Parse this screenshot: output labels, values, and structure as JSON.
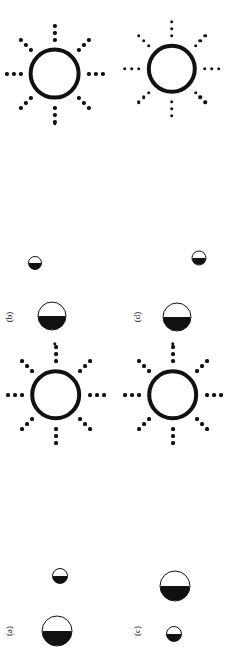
{
  "figure": {
    "title": "",
    "width": 231,
    "height": 667,
    "background": "#ffffff",
    "ink_color": "#111111",
    "panels": [
      {
        "id": "a",
        "label": "(a)",
        "label_x": 9,
        "label_y": 631
      },
      {
        "id": "b",
        "label": "(b)",
        "label_x": 9,
        "label_y": 317
      },
      {
        "id": "c",
        "label": "(c)",
        "label_x": 137,
        "label_y": 631
      },
      {
        "id": "d",
        "label": "(d)",
        "label_x": 137,
        "label_y": 317
      }
    ],
    "suns": [
      {
        "name": "sun-top-left",
        "panel": "b",
        "cx": 55,
        "cy": 74,
        "disc_diameter": 52,
        "disc_stroke": 4,
        "ray_count": 8,
        "dots_per_ray": 3,
        "ray_dot_size": 3.4,
        "ray_inner_radius": 34,
        "ray_dot_spacing": 7
      },
      {
        "name": "sun-top-right",
        "panel": "d",
        "cx": 172,
        "cy": 69,
        "disc_diameter": 50,
        "disc_stroke": 4,
        "ray_count": 8,
        "dots_per_ray": 3,
        "ray_dot_size": 3.2,
        "ray_inner_radius": 33,
        "ray_dot_spacing": 7
      },
      {
        "name": "sun-mid-left",
        "panel": "a",
        "cx": 56,
        "cy": 395,
        "disc_diameter": 51,
        "disc_stroke": 4,
        "ray_count": 8,
        "dots_per_ray": 3,
        "ray_dot_size": 3.3,
        "ray_inner_radius": 34,
        "ray_dot_spacing": 7
      },
      {
        "name": "sun-mid-right",
        "panel": "c",
        "cx": 173,
        "cy": 395,
        "disc_diameter": 51,
        "disc_stroke": 4,
        "ray_count": 8,
        "dots_per_ray": 3,
        "ray_dot_size": 3.3,
        "ray_inner_radius": 34,
        "ray_dot_spacing": 7
      }
    ],
    "half_circles": [
      {
        "name": "half-circle-b-small",
        "panel": "b",
        "cx": 35,
        "cy": 263,
        "diameter": 14,
        "fill_fraction": 0.5
      },
      {
        "name": "half-circle-b-large",
        "panel": "b",
        "cx": 52,
        "cy": 316,
        "diameter": 29,
        "fill_fraction": 0.5
      },
      {
        "name": "half-circle-d-small",
        "panel": "d",
        "cx": 199,
        "cy": 258,
        "diameter": 15,
        "fill_fraction": 0.5
      },
      {
        "name": "half-circle-d-large",
        "panel": "d",
        "cx": 177,
        "cy": 317,
        "diameter": 29,
        "fill_fraction": 0.5
      },
      {
        "name": "half-circle-a-small",
        "panel": "a",
        "cx": 60,
        "cy": 576,
        "diameter": 16,
        "fill_fraction": 0.5
      },
      {
        "name": "half-circle-a-large",
        "panel": "a",
        "cx": 57,
        "cy": 631,
        "diameter": 31,
        "fill_fraction": 0.5
      },
      {
        "name": "half-circle-c-large",
        "panel": "c",
        "cx": 175,
        "cy": 586,
        "diameter": 31,
        "fill_fraction": 0.5
      },
      {
        "name": "half-circle-c-small",
        "panel": "c",
        "cx": 174,
        "cy": 634,
        "diameter": 16,
        "fill_fraction": 0.5
      }
    ],
    "tiny_dots": [
      {
        "name": "tiny-dot-b-upper",
        "panel": "b",
        "cx": 55,
        "cy": 124,
        "size": 3.4
      },
      {
        "name": "tiny-dot-b-lower",
        "panel": "b",
        "cx": 55,
        "cy": 344,
        "size": 3.4
      },
      {
        "name": "tiny-dot-d-lower",
        "panel": "d",
        "cx": 173,
        "cy": 344,
        "size": 3.4
      }
    ]
  }
}
